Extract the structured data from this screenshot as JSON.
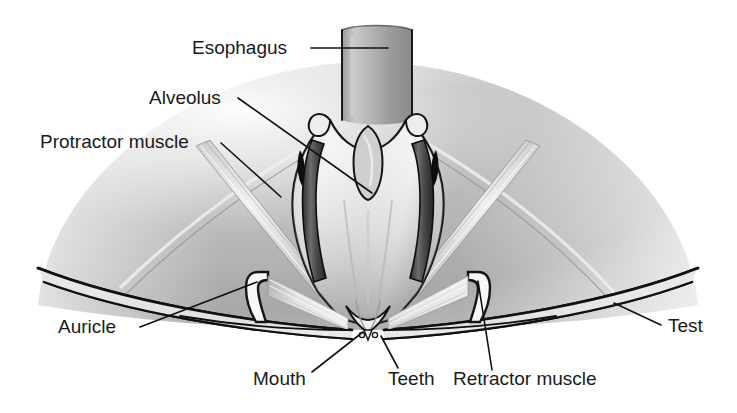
{
  "figure": {
    "background_color": "#ffffff",
    "ink_color": "#1a1a1a",
    "dome_gray": "#adadad",
    "highlight_gray": "#f2f2f2",
    "shadow_gray": "#6e6e6e"
  },
  "labels": {
    "esophagus": "Esophagus",
    "alveolus": "Alveolus",
    "protractor_muscle": "Protractor muscle",
    "auricle": "Auricle",
    "mouth": "Mouth",
    "teeth": "Teeth",
    "retractor_muscle": "Retractor muscle",
    "test": "Test"
  },
  "label_positions": {
    "esophagus": {
      "x": 192,
      "y": 54,
      "anchor": "start"
    },
    "alveolus": {
      "x": 149,
      "y": 104,
      "anchor": "start"
    },
    "protractor_muscle": {
      "x": 40,
      "y": 148,
      "anchor": "start"
    },
    "auricle": {
      "x": 58,
      "y": 333,
      "anchor": "start"
    },
    "mouth": {
      "x": 253,
      "y": 385,
      "anchor": "start"
    },
    "teeth": {
      "x": 388,
      "y": 385,
      "anchor": "start"
    },
    "retractor_muscle": {
      "x": 453,
      "y": 385,
      "anchor": "start"
    },
    "test": {
      "x": 668,
      "y": 332,
      "anchor": "start"
    }
  },
  "leader_lines": {
    "esophagus": "M 311,48 L 388,48",
    "alveolus": "M 238,98 L 372,193",
    "protractor_muscle": "M 221,143 L 281,197",
    "auricle": "M 140,327 L 257,282",
    "mouth": "M 312,372 L 363,332",
    "teeth": "M 398,368 L 381,336",
    "retractor_muscle": "M 492,370 L 478,281",
    "test": "M 661,325 L 614,303"
  },
  "icon_names": {
    "esophagus_tube": "esophagus-tube",
    "alveolus_body": "alveolus-body",
    "test_shell": "test-shell-dome",
    "left_auricle": "left-auricle",
    "right_auricle": "right-auricle",
    "teeth_tips": "teeth-tips"
  }
}
